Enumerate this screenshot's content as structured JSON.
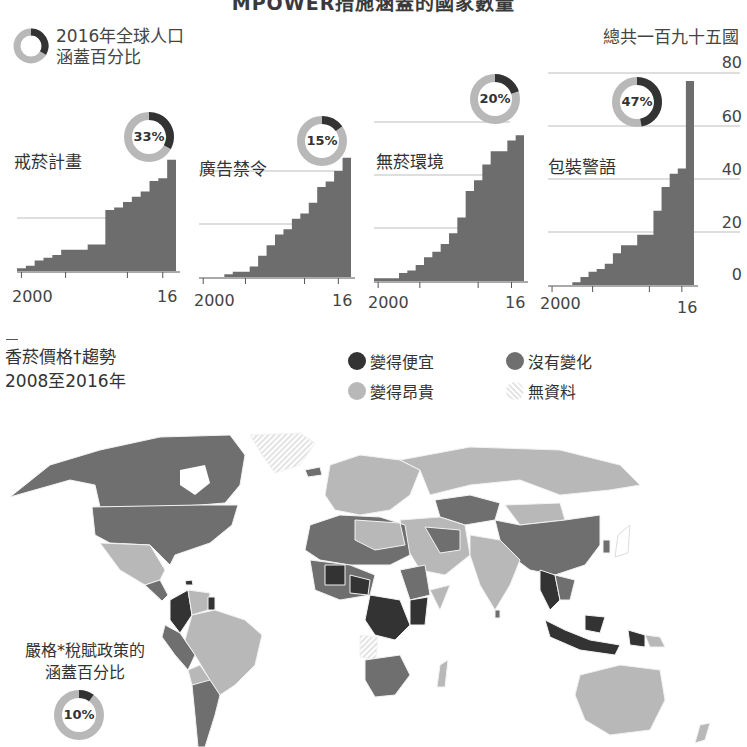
{
  "header": {
    "title_partial": "MPOWER措施涵蓋的國家數量",
    "donut_legend_line1": "2016年全球人口",
    "donut_legend_line2": "涵蓋百分比",
    "total_label": "總共一百九十五國"
  },
  "colors": {
    "dark": "#333333",
    "medium": "#6f6f6f",
    "light": "#b8b8b8",
    "nodata": "#e6e6e6",
    "bar": "#6d6d6d",
    "grid": "#bdbdbd"
  },
  "chart_data": [
    {
      "type": "bar",
      "title": "戒菸計畫",
      "donut_pct": 33,
      "donut_label": "33%",
      "categories": [
        "2000",
        "2001",
        "2002",
        "2003",
        "2004",
        "2005",
        "2006",
        "2007",
        "2008",
        "2009",
        "2010",
        "2011",
        "2012",
        "2013",
        "2014",
        "2015",
        "2016"
      ],
      "values": [
        1,
        2,
        4,
        5,
        6,
        8,
        8,
        8,
        10,
        10,
        23,
        24,
        26,
        28,
        30,
        34,
        35,
        42
      ],
      "xlabel_start": "2000",
      "xlabel_end": "16",
      "ylim": [
        0,
        80
      ]
    },
    {
      "type": "bar",
      "title": "廣告禁令",
      "donut_pct": 15,
      "donut_label": "15%",
      "categories": [
        "2000",
        "2001",
        "2002",
        "2003",
        "2004",
        "2005",
        "2006",
        "2007",
        "2008",
        "2009",
        "2010",
        "2011",
        "2012",
        "2013",
        "2014",
        "2015",
        "2016"
      ],
      "values": [
        0,
        0,
        0,
        1,
        2,
        2,
        4,
        8,
        12,
        16,
        18,
        22,
        24,
        28,
        34,
        36,
        40,
        45
      ],
      "xlabel_start": "2000",
      "xlabel_end": "16",
      "ylim": [
        0,
        80
      ]
    },
    {
      "type": "bar",
      "title": "無菸環境",
      "donut_pct": 20,
      "donut_label": "20%",
      "categories": [
        "2000",
        "2001",
        "2002",
        "2003",
        "2004",
        "2005",
        "2006",
        "2007",
        "2008",
        "2009",
        "2010",
        "2011",
        "2012",
        "2013",
        "2014",
        "2015",
        "2016"
      ],
      "values": [
        1,
        1,
        1,
        3,
        4,
        6,
        9,
        11,
        14,
        18,
        24,
        34,
        38,
        44,
        49,
        49,
        53,
        55
      ],
      "xlabel_start": "2000",
      "xlabel_end": "16",
      "ylim": [
        0,
        80
      ]
    },
    {
      "type": "bar",
      "title": "包裝警語",
      "donut_pct": 47,
      "donut_label": "47%",
      "categories": [
        "2000",
        "2001",
        "2002",
        "2003",
        "2004",
        "2005",
        "2006",
        "2007",
        "2008",
        "2009",
        "2010",
        "2011",
        "2012",
        "2013",
        "2014",
        "2015",
        "2016"
      ],
      "values": [
        0,
        0,
        0,
        1,
        3,
        5,
        6,
        8,
        12,
        15,
        15,
        19,
        19,
        28,
        37,
        42,
        44,
        77
      ],
      "xlabel_start": "2000",
      "xlabel_end": "16",
      "yticks": [
        "0",
        "20",
        "40",
        "60",
        "80"
      ],
      "ylim": [
        0,
        80
      ]
    }
  ],
  "price_section": {
    "title_line1": "香菸價格†趨勢",
    "title_line2": "2008至2016年",
    "legend": [
      {
        "label": "變得便宜",
        "color_key": "dark"
      },
      {
        "label": "沒有變化",
        "color_key": "medium"
      },
      {
        "label": "變得昂貴",
        "color_key": "light"
      },
      {
        "label": "無資料",
        "color_key": "nodata"
      }
    ]
  },
  "tax_note": {
    "line1": "嚴格*稅賦政策的",
    "line2": "涵蓋百分比",
    "donut_label": "10%",
    "donut_pct": 10
  }
}
